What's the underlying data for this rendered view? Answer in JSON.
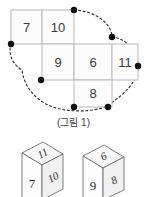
{
  "figure": {
    "caption": "(그림 1)",
    "cells": [
      {
        "id": "cell-7",
        "value": "7",
        "col": 0,
        "row": 0
      },
      {
        "id": "cell-10",
        "value": "10",
        "col": 1,
        "row": 0
      },
      {
        "id": "cell-9",
        "value": "9",
        "col": 1,
        "row": 1
      },
      {
        "id": "cell-6",
        "value": "6",
        "col": 2,
        "row": 1
      },
      {
        "id": "cell-11",
        "value": "11",
        "col": 3,
        "row": 1
      },
      {
        "id": "cell-8",
        "value": "8",
        "col": 2,
        "row": 2
      }
    ],
    "loop_dot_count": "6",
    "colors": {
      "cell_fill": "#fcfcfc",
      "cell_border": "#b9b9b9",
      "number": "#3b3b3b",
      "dot": "#111111",
      "dash": "#333333"
    }
  },
  "cubes": [
    {
      "id": "cube-left",
      "front": "7",
      "top": "11",
      "side": "10"
    },
    {
      "id": "cube-right",
      "front": "9",
      "top": "6",
      "side": "8"
    }
  ]
}
